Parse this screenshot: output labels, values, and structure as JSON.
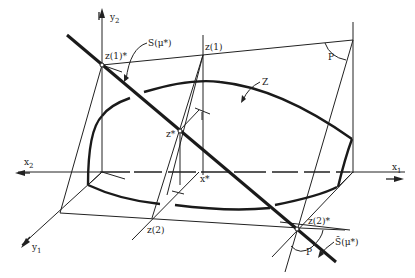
{
  "figure": {
    "type": "3d-geometric-diagram",
    "axes": {
      "y2": "y",
      "y2_sub": "2",
      "y1": "y",
      "y1_sub": "1",
      "x1": "x",
      "x1_sub": "1",
      "x2": "x",
      "x2_sub": "2"
    },
    "labels": {
      "z1_star": "z(1)*",
      "z1": "z(1)",
      "z_star": "z*",
      "x_star": "x*",
      "z2": "z(2)",
      "z2_star": "z(2)*",
      "S_mu": "S(μ*)",
      "S_bar_mu": "S̄(μ*)",
      "Z": "Z",
      "P_top": "P",
      "P_bottom": "P"
    }
  }
}
